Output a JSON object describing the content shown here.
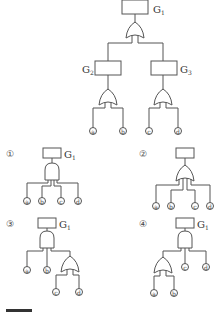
{
  "main_tree": {
    "top_event": "G1",
    "top_gate": "OR",
    "intermediate": [
      {
        "label": "G2",
        "gate": "OR",
        "inputs": [
          "a",
          "b"
        ]
      },
      {
        "label": "G3",
        "gate": "OR",
        "inputs": [
          "c",
          "d"
        ]
      }
    ]
  },
  "options": [
    {
      "number": "①",
      "top_label": "G1",
      "gate": "AND",
      "inputs": [
        "a",
        "b",
        "c",
        "d"
      ]
    },
    {
      "number": "②",
      "top_label": "",
      "gate": "OR",
      "inputs": [
        "a",
        "b",
        "c",
        "d"
      ]
    },
    {
      "number": "③",
      "top_label": "G1",
      "gate": "AND",
      "inputs": [
        "a",
        "b",
        {
          "gate": "OR",
          "inputs": [
            "c",
            "d"
          ]
        }
      ]
    },
    {
      "number": "④",
      "top_label": "G1",
      "gate": "AND",
      "inputs": [
        {
          "gate": "OR",
          "inputs": [
            "a",
            "b"
          ]
        },
        "c",
        "d"
      ]
    }
  ],
  "labels": {
    "g1": "G",
    "g1_sub": "1",
    "g2": "G",
    "g2_sub": "2",
    "g3": "G",
    "g3_sub": "3",
    "a": "a",
    "b": "b",
    "c": "c",
    "d": "d",
    "opt1": "①",
    "opt2": "②",
    "opt3": "③",
    "opt4": "④"
  }
}
